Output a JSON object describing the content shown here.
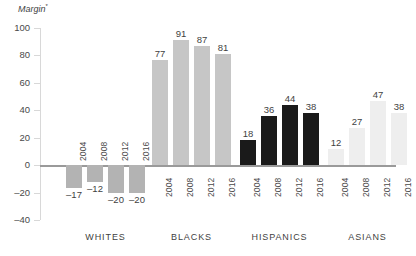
{
  "chart_data": {
    "type": "bar",
    "title": "",
    "ylabel": "Margin",
    "ylabel_superscript": "*",
    "xlabel": "",
    "ylim": [
      -40,
      100
    ],
    "yticks": [
      100,
      80,
      60,
      40,
      20,
      0,
      -20,
      -40
    ],
    "ytick_labels": [
      "100",
      "80",
      "60",
      "40",
      "20",
      "0",
      "–20",
      "–40"
    ],
    "grid": false,
    "legend": "none",
    "categories": [
      "2004",
      "2008",
      "2012",
      "2016"
    ],
    "groups": [
      {
        "name": "WHITES",
        "color": "#b3b3b3",
        "values": [
          -17,
          -12,
          -20,
          -20
        ],
        "value_labels": [
          "–17",
          "–12",
          "–20",
          "–20"
        ],
        "years": [
          "2004",
          "2008",
          "2012",
          "2016"
        ]
      },
      {
        "name": "BLACKS",
        "color": "#c6c6c6",
        "values": [
          77,
          91,
          87,
          81
        ],
        "value_labels": [
          "77",
          "91",
          "87",
          "81"
        ],
        "years": [
          "2004",
          "2008",
          "2012",
          "2016"
        ]
      },
      {
        "name": "HISPANICS",
        "color": "#1a1a1a",
        "values": [
          18,
          36,
          44,
          38
        ],
        "value_labels": [
          "18",
          "36",
          "44",
          "38"
        ],
        "years": [
          "2004",
          "2008",
          "2012",
          "2016"
        ]
      },
      {
        "name": "ASIANS",
        "color": "#eeeeee",
        "values": [
          12,
          27,
          47,
          38
        ],
        "value_labels": [
          "12",
          "27",
          "47",
          "38"
        ],
        "years": [
          "2004",
          "2008",
          "2012",
          "2016"
        ]
      }
    ],
    "axis_color": "#9a9a9a",
    "tick_color": "#d8d8d8",
    "text_color": "#3f3f3f",
    "background": "#ffffff"
  }
}
